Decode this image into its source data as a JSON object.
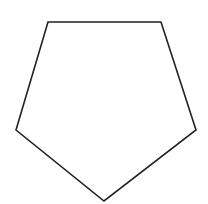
{
  "diagram": {
    "shape": "pentagon",
    "label": "",
    "vertices": [
      {
        "x": 48,
        "y": 22
      },
      {
        "x": 161,
        "y": 22
      },
      {
        "x": 196,
        "y": 130
      },
      {
        "x": 104,
        "y": 201
      },
      {
        "x": 16,
        "y": 130
      }
    ],
    "stroke_color": "#222222",
    "fill_color": "#ffffff",
    "background_color": "#ffffff",
    "stroke_width": 1.6
  }
}
